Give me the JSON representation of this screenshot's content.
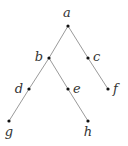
{
  "diagram": {
    "type": "tree",
    "colors": {
      "edge": "#9a9a9a",
      "node": "#111111",
      "label": "#333333"
    },
    "nodes": [
      {
        "id": "a",
        "label": "a",
        "x": 68,
        "y": 26,
        "lx": 67,
        "ly": 17,
        "anchor": "middle"
      },
      {
        "id": "b",
        "label": "b",
        "x": 49,
        "y": 58,
        "lx": 43,
        "ly": 61,
        "anchor": "end"
      },
      {
        "id": "c",
        "label": "c",
        "x": 88,
        "y": 58,
        "lx": 93,
        "ly": 61,
        "anchor": "start"
      },
      {
        "id": "d",
        "label": "d",
        "x": 29,
        "y": 89,
        "lx": 23,
        "ly": 93,
        "anchor": "end"
      },
      {
        "id": "e",
        "label": "e",
        "x": 68,
        "y": 89,
        "lx": 73,
        "ly": 93,
        "anchor": "start"
      },
      {
        "id": "f",
        "label": "f",
        "x": 108,
        "y": 89,
        "lx": 113,
        "ly": 93,
        "anchor": "start"
      },
      {
        "id": "g",
        "label": "g",
        "x": 9,
        "y": 121,
        "lx": 9,
        "ly": 136,
        "anchor": "middle"
      },
      {
        "id": "h",
        "label": "h",
        "x": 88,
        "y": 121,
        "lx": 88,
        "ly": 136,
        "anchor": "middle"
      }
    ],
    "edges": [
      [
        "a",
        "b"
      ],
      [
        "b",
        "d"
      ],
      [
        "d",
        "g"
      ],
      [
        "b",
        "e"
      ],
      [
        "e",
        "h"
      ],
      [
        "a",
        "c"
      ],
      [
        "c",
        "f"
      ]
    ]
  }
}
